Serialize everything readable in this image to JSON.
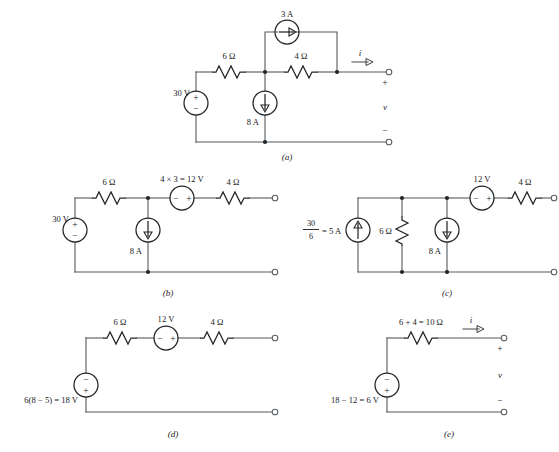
{
  "figure": {
    "background_color": "#ffffff",
    "wire_color": "#555a5e",
    "component_color": "#232629"
  },
  "captions": {
    "a": "(a)",
    "b": "(b)",
    "c": "(c)",
    "d": "(d)",
    "e": "(e)"
  },
  "circuit_a": {
    "label": "(a)",
    "source_30v": "30 V",
    "resistor_6ohm": "6 Ω",
    "resistor_4ohm": "4 Ω",
    "source_3a": "3 A",
    "source_8a": "8 A",
    "current_label": "i",
    "voltage_label": "v",
    "plus": "+",
    "minus": "−",
    "src30_plus": "+",
    "src30_minus": "−"
  },
  "circuit_b": {
    "label": "(b)",
    "source_30v": "30 V",
    "resistor_6ohm": "6 Ω",
    "source_12v": "4 × 3 = 12 V",
    "resistor_4ohm": "4 Ω",
    "source_8a": "8 A",
    "src30_plus": "+",
    "src30_minus": "−",
    "src12_minus": "−",
    "src12_plus": "+"
  },
  "circuit_c": {
    "label": "(c)",
    "source_5a_numerator": "30",
    "source_5a_denominator": "6",
    "source_5a_result": "= 5 A",
    "resistor_6ohm": "6 Ω",
    "source_8a": "8 A",
    "source_12v": "12 V",
    "resistor_4ohm": "4 Ω",
    "src12_minus": "−",
    "src12_plus": "+"
  },
  "circuit_d": {
    "label": "(d)",
    "source_18v": "6(8 − 5) = 18 V",
    "resistor_6ohm": "6 Ω",
    "source_12v": "12 V",
    "resistor_4ohm": "4 Ω",
    "src18_minus": "−",
    "src18_plus": "+",
    "src12_minus": "−",
    "src12_plus": "+"
  },
  "circuit_e": {
    "label": "(e)",
    "source_6v": "18 − 12 = 6 V",
    "resistor_10ohm": "6 + 4 = 10 Ω",
    "current_label": "i",
    "voltage_label": "v",
    "plus": "+",
    "minus": "−",
    "src6_minus": "−",
    "src6_plus": "+"
  }
}
